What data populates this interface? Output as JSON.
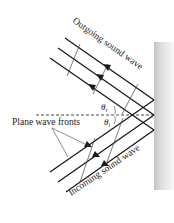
{
  "diagram": {
    "labels": {
      "outgoing": "Outgoing sound wave",
      "incoming": "Incoming sound wave",
      "wavefronts": "Plane wave fronts",
      "theta_r": "θ",
      "theta_r_sub": "r",
      "theta_i": "θ",
      "theta_i_sub": "i"
    },
    "colors": {
      "line": "#1a1a1a",
      "wall_light": "#f2f2f2",
      "wall_dark": "#c8c8c8",
      "thin": "#444444"
    }
  }
}
